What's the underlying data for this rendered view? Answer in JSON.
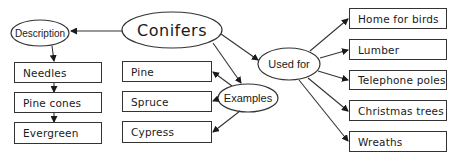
{
  "diagram": {
    "type": "concept-map",
    "central": {
      "label": "Conifers"
    },
    "branches": {
      "description": {
        "label": "Description",
        "items": [
          "Needles",
          "Pine cones",
          "Evergreen"
        ]
      },
      "examples": {
        "label": "Examples",
        "items": [
          "Pine",
          "Spruce",
          "Cypress"
        ]
      },
      "used_for": {
        "label": "Used for",
        "items": [
          "Home for birds",
          "Lumber",
          "Telephone poles",
          "Christmas trees",
          "Wreaths"
        ]
      }
    }
  },
  "colors": {
    "stroke": "#333333",
    "text": "#1a1a1a",
    "background": "#ffffff"
  }
}
